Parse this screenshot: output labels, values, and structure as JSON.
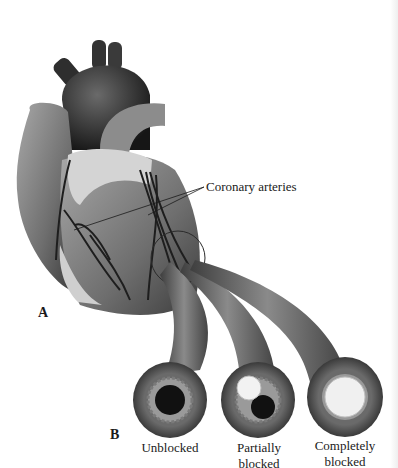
{
  "figure": {
    "panel_a_label": "A",
    "panel_b_label": "B",
    "callout_label": "Coronary arteries",
    "artery_states": [
      {
        "label": "Unblocked"
      },
      {
        "label": "Partially blocked",
        "line1": "Partially",
        "line2": "blocked"
      },
      {
        "label": "Completely blocked",
        "line1": "Completely",
        "line2": "blocked"
      }
    ],
    "colors": {
      "background": "#ffffff",
      "heart_dark": "#2a2a2a",
      "heart_mid": "#7a7a7a",
      "fat_light": "#d8d8d8",
      "plaque": "#f2f2f2",
      "text": "#1a1a1a"
    }
  }
}
